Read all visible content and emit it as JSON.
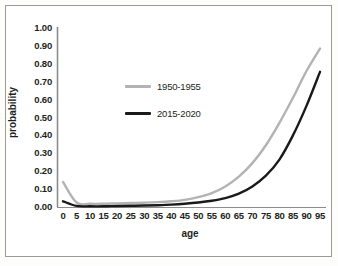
{
  "chart_data": {
    "type": "line",
    "title": "",
    "xlabel": "age",
    "ylabel": "probability",
    "xlim": [
      0,
      95
    ],
    "ylim": [
      0,
      1.0
    ],
    "grid": false,
    "legend_position": "center-left-inside",
    "x": [
      0,
      5,
      10,
      15,
      20,
      25,
      30,
      35,
      40,
      45,
      50,
      55,
      60,
      65,
      70,
      75,
      80,
      85,
      90,
      95
    ],
    "xticklabels": [
      "0",
      "5",
      "10",
      "15",
      "20",
      "25",
      "30",
      "35",
      "40",
      "45",
      "50",
      "55",
      "60",
      "65",
      "70",
      "75",
      "80",
      "85",
      "90",
      "95"
    ],
    "yticklabels": [
      "0.00",
      "0.10",
      "0.20",
      "0.30",
      "0.40",
      "0.50",
      "0.60",
      "0.70",
      "0.80",
      "0.90",
      "1.00"
    ],
    "ytickvalues": [
      0.0,
      0.1,
      0.2,
      0.3,
      0.4,
      0.5,
      0.6,
      0.7,
      0.8,
      0.9,
      1.0
    ],
    "series": [
      {
        "name": "1950-1955",
        "color": "#b3b3b3",
        "values": [
          0.14,
          0.025,
          0.018,
          0.018,
          0.02,
          0.022,
          0.024,
          0.027,
          0.032,
          0.04,
          0.055,
          0.078,
          0.115,
          0.17,
          0.245,
          0.345,
          0.47,
          0.61,
          0.76,
          0.885
        ]
      },
      {
        "name": "2015-2020",
        "color": "#1a1a1a",
        "values": [
          0.032,
          0.006,
          0.004,
          0.004,
          0.006,
          0.007,
          0.008,
          0.01,
          0.013,
          0.018,
          0.025,
          0.035,
          0.05,
          0.075,
          0.115,
          0.175,
          0.265,
          0.4,
          0.565,
          0.755
        ]
      }
    ]
  },
  "legend": {
    "entries": [
      {
        "label": "1950-1955",
        "color": "#b3b3b3"
      },
      {
        "label": "2015-2020",
        "color": "#1a1a1a"
      }
    ]
  },
  "axes": {
    "x_title": "age",
    "y_title": "probability"
  }
}
